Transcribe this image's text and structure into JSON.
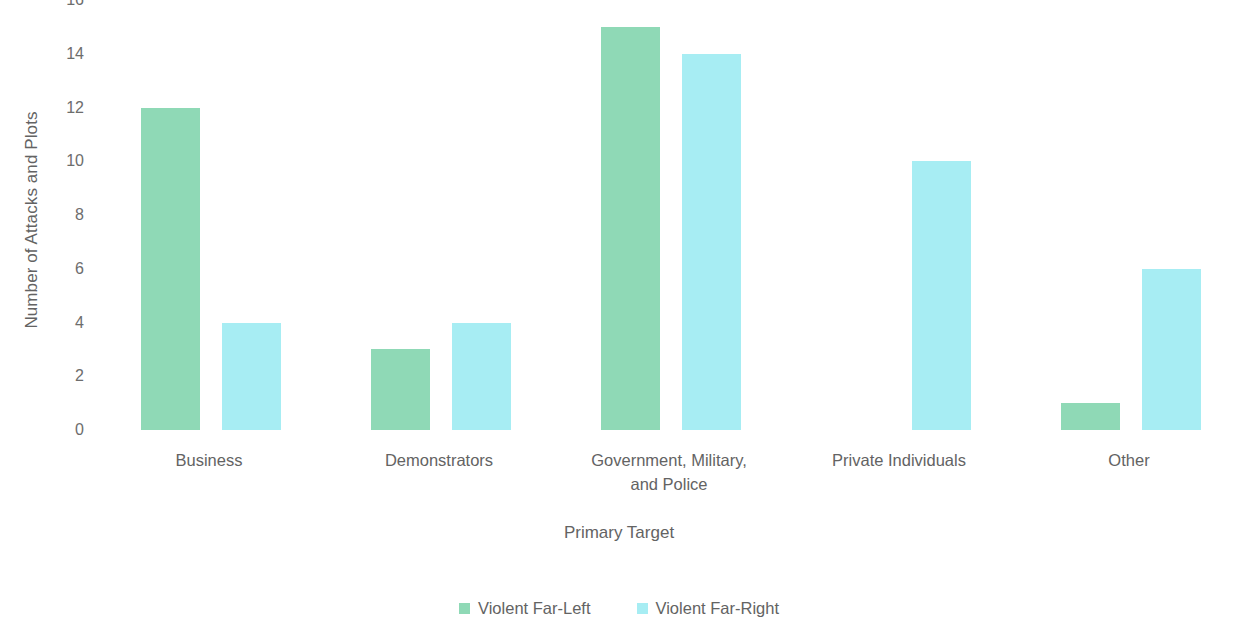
{
  "chart_data": {
    "type": "bar",
    "title": "",
    "xlabel": "Primary Target",
    "ylabel": "Number of Attacks and Plots",
    "categories": [
      "Business",
      "Demonstrators",
      "Government, Military, and Police",
      "Private Individuals",
      "Other"
    ],
    "series": [
      {
        "name": "Violent Far-Left",
        "color": "#8fd9b6",
        "values": [
          12,
          3,
          15,
          0,
          1
        ]
      },
      {
        "name": "Violent Far-Right",
        "color": "#a7edf3",
        "values": [
          4,
          4,
          14,
          10,
          6
        ]
      }
    ],
    "ylim": [
      0,
      16
    ],
    "ytick_labels": [
      "16",
      "14",
      "12",
      "10",
      "8",
      "6",
      "4",
      "2",
      "0"
    ],
    "ytick_values": [
      16,
      14,
      12,
      10,
      8,
      6,
      4,
      2,
      0
    ],
    "grid": false,
    "legend_position": "bottom"
  },
  "axes": {
    "y_title": "Number of Attacks and Plots",
    "x_title": "Primary Target"
  },
  "category_labels": [
    {
      "line1": "Business",
      "line2": ""
    },
    {
      "line1": "Demonstrators",
      "line2": ""
    },
    {
      "line1": "Government, Military,",
      "line2": "and Police"
    },
    {
      "line1": "Private Individuals",
      "line2": ""
    },
    {
      "line1": "Other",
      "line2": ""
    }
  ],
  "legend": {
    "items": [
      {
        "label": "Violent Far-Left",
        "color": "#8fd9b6"
      },
      {
        "label": "Violent Far-Right",
        "color": "#a7edf3"
      }
    ]
  }
}
